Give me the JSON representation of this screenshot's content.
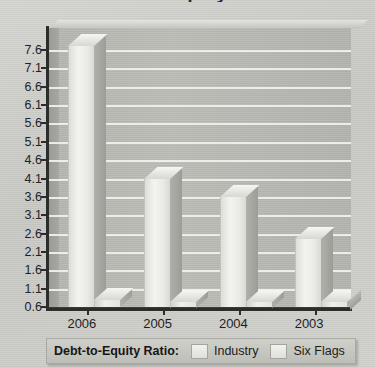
{
  "chart_data": {
    "type": "bar",
    "title": "Debt-to-Equity Ratio",
    "xlabel": "",
    "ylabel": "",
    "ylim": [
      0.6,
      7.6
    ],
    "ytick_step": 0.5,
    "grid": true,
    "legend_position": "bottom",
    "legend_title": "Debt-to-Equity Ratio:",
    "categories": [
      "2006",
      "2005",
      "2004",
      "2003"
    ],
    "yticks": [
      "7.6",
      "7.1",
      "6.6",
      "6.1",
      "5.6",
      "5.1",
      "4.6",
      "4.1",
      "3.6",
      "3.1",
      "2.6",
      "2.1",
      "1.6",
      "1.1",
      "0.6"
    ],
    "series": [
      {
        "name": "Industry",
        "values": [
          7.7,
          4.1,
          3.6,
          2.45
        ]
      },
      {
        "name": "Six Flags",
        "values": [
          0.78,
          0.75,
          0.75,
          0.74
        ]
      }
    ],
    "colors": {
      "industry": "#efefeb",
      "six_flags": "#e2e2dd",
      "plot_background": "#b9b9b4",
      "gridline": "#f1f1ee",
      "axis": "#2c2c2a",
      "page_background": "#d0d0cc"
    }
  },
  "legend": {
    "title": "Debt-to-Equity Ratio:",
    "entries": [
      {
        "label": "Industry",
        "swatch_name": "legend-swatch-industry"
      },
      {
        "label": "Six Flags",
        "swatch_name": "legend-swatch-six-flags"
      }
    ]
  }
}
